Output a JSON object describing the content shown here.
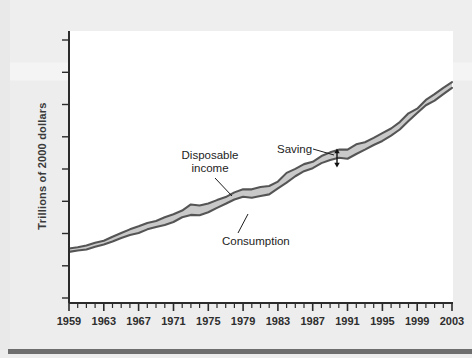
{
  "figure": {
    "ylabel": "Trillions of 2000 dollars",
    "background_color": "#efefef",
    "plot_background_color": "#ffffff",
    "rule_color": "#6e6e6e"
  },
  "annotations": {
    "disposable_income_line1": "Disposable",
    "disposable_income_line2": "income",
    "consumption": "Consumption",
    "saving": "Saving"
  },
  "axis": {
    "x_tick_labels": [
      "1959",
      "1963",
      "1967",
      "1971",
      "1975",
      "1979",
      "1983",
      "1987",
      "1991",
      "1995",
      "1999",
      "2003"
    ],
    "x_minor_tick_interval_years": 1,
    "y_tick_count": 9,
    "y_tick_labels": []
  },
  "chart_data": {
    "type": "area",
    "title": "",
    "subtitle": "",
    "xlabel": "",
    "ylabel": "Trillions of 2000 dollars",
    "grid": false,
    "legend_position": "inline-annotations",
    "xlim": [
      1959,
      2003
    ],
    "ylim": [
      0,
      8
    ],
    "x_tick_labels": [
      "1959",
      "1963",
      "1967",
      "1971",
      "1975",
      "1979",
      "1983",
      "1987",
      "1991",
      "1995",
      "1999",
      "2003"
    ],
    "annotations": [
      {
        "text": "Disposable income",
        "points_to": "upper-boundary-line",
        "x": 1977
      },
      {
        "text": "Consumption",
        "points_to": "lower-boundary-line",
        "x": 1980
      },
      {
        "text": "Saving",
        "points_to": "vertical-gap-between-lines",
        "x": 1990
      }
    ],
    "series": [
      {
        "name": "Disposable income",
        "style": "upper boundary of shaded band",
        "color": "#555555",
        "x": [
          1959,
          1960,
          1961,
          1962,
          1963,
          1964,
          1965,
          1966,
          1967,
          1968,
          1969,
          1970,
          1971,
          1972,
          1973,
          1974,
          1975,
          1976,
          1977,
          1978,
          1979,
          1980,
          1981,
          1982,
          1983,
          1984,
          1985,
          1986,
          1987,
          1988,
          1989,
          1990,
          1991,
          1992,
          1993,
          1994,
          1995,
          1996,
          1997,
          1998,
          1999,
          2000,
          2001,
          2002,
          2003
        ],
        "values": [
          1.62,
          1.66,
          1.71,
          1.79,
          1.85,
          1.97,
          2.08,
          2.19,
          2.28,
          2.38,
          2.44,
          2.55,
          2.64,
          2.75,
          2.93,
          2.9,
          2.96,
          3.06,
          3.15,
          3.29,
          3.38,
          3.38,
          3.45,
          3.48,
          3.61,
          3.87,
          3.99,
          4.13,
          4.2,
          4.37,
          4.48,
          4.56,
          4.56,
          4.72,
          4.78,
          4.91,
          5.05,
          5.19,
          5.38,
          5.64,
          5.78,
          6.04,
          6.21,
          6.4,
          6.57
        ]
      },
      {
        "name": "Consumption",
        "style": "lower boundary of shaded band",
        "color": "#555555",
        "x": [
          1959,
          1960,
          1961,
          1962,
          1963,
          1964,
          1965,
          1966,
          1967,
          1968,
          1969,
          1970,
          1971,
          1972,
          1973,
          1974,
          1975,
          1976,
          1977,
          1978,
          1979,
          1980,
          1981,
          1982,
          1983,
          1984,
          1985,
          1986,
          1987,
          1988,
          1989,
          1990,
          1991,
          1992,
          1993,
          1994,
          1995,
          1996,
          1997,
          1998,
          1999,
          2000,
          2001,
          2002,
          2003
        ],
        "values": [
          1.52,
          1.56,
          1.59,
          1.67,
          1.74,
          1.83,
          1.93,
          2.02,
          2.08,
          2.19,
          2.26,
          2.32,
          2.41,
          2.55,
          2.62,
          2.61,
          2.7,
          2.83,
          2.95,
          3.08,
          3.16,
          3.13,
          3.18,
          3.23,
          3.41,
          3.58,
          3.77,
          3.92,
          4.01,
          4.16,
          4.25,
          4.32,
          4.29,
          4.43,
          4.56,
          4.7,
          4.82,
          4.98,
          5.16,
          5.41,
          5.65,
          5.88,
          6.02,
          6.21,
          6.4
        ]
      }
    ],
    "band": {
      "name": "Saving",
      "description": "Shaded region between disposable income and consumption",
      "fill_color": "#c9c9c9"
    }
  }
}
